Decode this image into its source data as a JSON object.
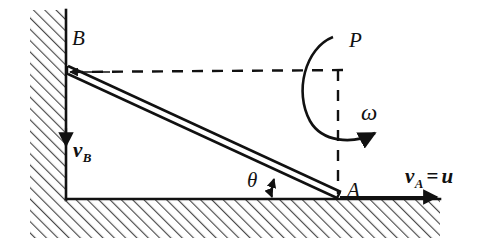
{
  "figure": {
    "background_color": "#ffffff",
    "line_color": "#111111",
    "hatch_color": "#555555"
  },
  "labels": {
    "point_b": "B",
    "point_a": "A",
    "point_p": "P",
    "omega": "ω",
    "theta": "θ",
    "v_b_symbol": "v",
    "v_b_sub": "B",
    "v_a_symbol": "v",
    "v_a_sub": "A",
    "v_a_equals": "=",
    "v_a_value": "u"
  },
  "elements": {
    "wall": "hatched-vertical-wall",
    "ground": "hatched-horizontal-ground",
    "rod": "slender-rod-AB",
    "dashed_horizontal": "dashed-line-B-to-P",
    "dashed_vertical": "dashed-line-P-to-A",
    "angle_arc": "angle-theta-double-arrow",
    "rotation_arc": "omega-rotation-arrow",
    "vb_arrow": "velocity-B-arrow-down",
    "va_arrow": "velocity-A-arrow-right",
    "b_arrow": "arrowhead-at-B-left"
  },
  "geometry": {
    "point_b": [
      68,
      68
    ],
    "point_a": [
      338,
      196
    ],
    "point_p": [
      338,
      68
    ],
    "wall_x": 66,
    "ground_y": 198
  }
}
